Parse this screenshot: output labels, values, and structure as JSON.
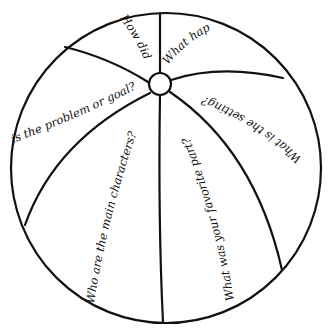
{
  "colors": {
    "ink": "#111111",
    "background": "#ffffff"
  },
  "questions": [
    {
      "id": "how-did",
      "text": "How did"
    },
    {
      "id": "what-happened",
      "text": "What hap"
    },
    {
      "id": "setting",
      "text": "What is the setting?"
    },
    {
      "id": "problem",
      "text": "is the problem or goal?"
    },
    {
      "id": "characters",
      "text": "Who are the main characters?"
    },
    {
      "id": "favorite-part",
      "text": "What was your favorite part?"
    }
  ]
}
